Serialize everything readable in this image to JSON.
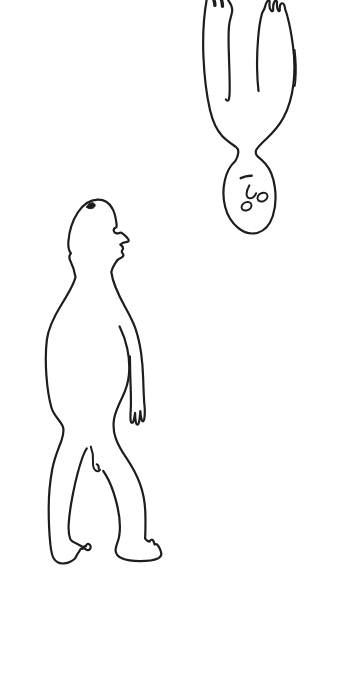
{
  "canvas": {
    "width": 354,
    "height": 679,
    "background": "#ffffff",
    "ink": "#1d1d1d",
    "stroke_width": 2.2
  },
  "drawing": {
    "figures": [
      {
        "name": "standing-figure",
        "paths": [
          {
            "name": "head-back-body-back-leg-outline",
            "d": "M 112,208 C 109,202.5 103.5,199.4 97.5,199.6 C 90.5,199.8 83,204.5 77.8,212.5 C 72.4,220.8 69.2,230.5 68.4,241.5 C 68,247 69,251 70.9,253.2 C 69.3,255.2 68.8,257.8 70.3,260.8 C 72.2,264.6 74.3,269.8 75.5,277 C 74,284 69.8,291.2 61.5,304.5 C 53.5,317.5 48.4,327.5 46.9,339.5 C 45.4,351.5 45.6,364 46.4,375.5 C 47.2,386.5 48.6,397.5 51.4,407.5 C 53.6,415.5 59.4,419.5 62.4,425.5 C 64.2,429.1 64,432.9 61.6,440.1 C 59.2,447.3 54.6,456.5 52.2,469.5 C 49.8,482.5 48.7,495.5 48.7,508.5 C 48.7,521.5 49.3,534 50.3,544 C 51,550.5 52,555.4 53.6,558.3 C 55.9,562.2 59.9,563.9 64.4,563.4 C 68.2,563 72.2,561.2 75.2,558.2 C 76.6,555.4 78.2,552.8 79.4,551.2 C 80.1,549.1 81.5,548 82.7,548.9 C 83.1,546.7 84.5,545.5 85.9,546.3 C 86.3,544.3 87.7,543.4 89.1,544.2 C 90.7,545.1 91.1,547.2 90.1,548.8 C 89.1,550.4 87.3,550.6 85.9,549.4 C 83.9,547.8 80.9,545.3 77.4,543.9 C 73.9,542.5 71.2,541.2 70.2,538.8 C 69,535.5 68.4,531 68.6,525.5 C 69,516.5 70.6,505.5 73.2,492.5 C 75.8,479.5 79.2,466.5 82.8,456.5 C 84.2,452.7 85.6,449.9 86.8,448.3"
          },
          {
            "name": "face-profile-neck-arm-hand",
            "d": "M 112,208 C 114.2,211.2 115.6,216.5 116.5,223.5 C 116.7,225.3 116.6,226.5 116.3,227.3 C 114.6,227.9 113.4,229.5 113.9,231.2 C 114.5,233.2 117.1,233.9 119.3,232.9 C 120.5,232.4 121.5,232.7 122.7,233.7 C 124.7,235.2 126.9,236.9 128.3,239.3 C 129,240.5 128.6,241.7 127.1,241.9 C 124.9,242.2 121.9,243.1 120.3,244.5 C 122.5,246.1 123.7,248.1 122.5,249.9 C 121.5,251.3 121.3,252.2 122.7,253.5 C 123.9,254.7 123.5,256.6 121.5,257.5 C 119.1,258.5 117.1,260.1 115.9,262.1 C 113.7,265.4 112.1,268.4 111.3,272 C 111.9,276.5 113.3,281.5 115.5,287 C 117.9,293 121.1,299.8 124.7,306.3 C 128.5,313.2 132.3,319.9 135.3,328.2 C 138.1,336.2 139.9,344.7 141.2,353.7 C 142.3,361.7 142.9,370.2 143.2,378.7 C 143.4,386.7 143.8,395.2 144.2,402.7 L 144.5,405.5 C 144.9,409.3 144.9,414.8 144.3,418.8 C 143.8,421.9 142.4,422.3 141.6,419.4 C 140.9,416.9 140.5,413.8 140.3,411 C 140,414.4 139.8,418.9 139,422.3 C 138.3,425.5 136.6,425.6 135.9,422.5 C 135.3,419.7 135.1,416 135.1,412.8 C 134.7,415.6 134.3,419 133.4,421.3 C 132.5,423.7 130.9,423.2 130.6,420.4 C 130.3,417.2 130.5,412.8 130.8,408.8 C 131.1,402.3 130.9,393.8 130.6,385.3 C 130.3,377.3 130.1,368.3 130,361.3 L 129.9,356.3"
          },
          {
            "name": "chest-hip-front-leg-foot",
            "d": "M 119.6,326.5 C 122.6,332.5 125.5,340.3 127.3,348.8 C 129.1,357.3 129.7,366.3 128.9,374.8 C 128.1,382.8 125.7,390.3 122.3,397.3 C 118.9,404.3 115.5,411.3 114.2,418.3 C 113,424.8 113.4,431.3 115.6,437.8 C 117.9,444.6 121.7,451.1 126.5,458.1 C 131.9,466.1 136.7,474.6 140.1,484.1 C 143.4,493.4 145,503.1 145.3,512.1 C 145.6,521.1 145.5,530.1 145.1,538.6 C 146.4,540.4 148,541.4 149.6,541.6 C 150.4,539.4 152.4,539 153.4,541 C 153.8,541.9 154.4,543.3 154.6,544.5 C 155.8,543.9 157.4,544.5 158.4,546.1 C 159.8,548.3 161,550.9 161.3,553.1 C 161.6,555.3 160.3,557.3 157.8,558.5 C 153.8,560.3 147.3,561.1 140.3,561.1 C 133.3,561.1 126.3,560.3 121.8,558.3 C 118.3,556.7 115.9,554.1 115.6,550.6 C 115.4,547.8 116.6,544.9 118,540.9 C 119.3,537.1 119.9,532.1 119.9,526.6 C 119.9,518.6 118.3,509.1 115.7,499.6 C 113.1,490.1 109.5,481.1 105.9,475.1 L 103.2,470.9"
          },
          {
            "name": "crotch-squiggle",
            "d": "M 90.8,446.6 C 92.6,451.2 93.4,456.4 93,461.4 C 92.7,465.4 93.4,468.6 95.3,470.3 C 97.1,471.9 99.3,471.5 100.1,469.6",
            "w": 2
          },
          {
            "name": "crotch-mark",
            "d": "M 96.6,464.2 C 98.3,465 99.1,466.9 98.6,468.9",
            "w": 2
          },
          {
            "name": "head-ink-blob",
            "d": "M 86.6,207.2 C 87.4,204 90.6,202 93.4,203 C 95.8,203.9 95.8,206.6 93.4,207.9 C 91,209.2 88,208.9 86.6,207.2 Z",
            "fill": "#1d1d1d",
            "w": 1
          }
        ]
      },
      {
        "name": "inverted-figure",
        "paths": [
          {
            "name": "torso-arms-head-outline",
            "d": "M 206.6,0 C 203.8,16 202.6,36 203.4,56 C 204.2,75.5 206.4,94.5 210,110 C 212.6,121 216.6,130 222.2,136 C 226.6,140.7 231.6,143.9 235.9,146.9 C 237.7,148.2 238.5,150 238.3,152.6 C 238.1,155.6 237.1,158.3 235.1,161.3 C 230.5,165.4 226.7,172 224.8,180.5 C 222.9,189 223,198.5 225.2,207 C 227.4,215.5 231.8,222.6 237.8,227.6 C 243.8,232.6 251,234.7 257.8,232.7 C 264.6,230.7 270,224.5 272.8,216 C 275.6,207.5 276.2,197 274.8,187 C 273.4,177 270,169 265.4,163.8 C 262.8,160.8 260,158.4 257.6,156.4 C 256,155 255.4,152.8 256,150.2 C 258,146.8 262,142.8 267,138.2 C 273,132.6 279,125.8 283.4,117.8 C 288.4,108.3 291.9,96.8 293.4,84.3 C 294.9,71.8 294.7,58.3 292.9,45.3 C 291.7,36.3 289.8,25.3 287.4,16.3 C 286.8,13.8 286,11.3 285.2,9.3 C 284.8,5.3 283.6,2.9 282,3.3 C 280.4,3.7 279.6,6.4 279.8,9.4 C 279.9,11.1 279.4,11.7 278.4,10.7 C 277.2,9.4 276.8,5.9 277,2.9 C 277.1,0.7 275.8,-0.1 274.6,1.5 C 273.4,3.1 273,6.4 273.2,9.4 C 273.3,11.3 272.4,11.8 271.2,10.6 C 269.8,9.1 269.2,5.4 269.6,2.3 C 269.8,0.5 268.6,-0.3 267.4,1.1 C 266.2,2.5 265.4,4.9 264.8,7.5 C 264.2,9.9 262.6,11.5 261.9,13.7 C 260.3,19.7 258.9,28.3 258.1,38.3 C 257.3,48.3 256.9,58.3 257.1,68.3 C 257.2,76.3 257.7,84.3 258.5,90.9"
          },
          {
            "name": "left-inner-arm",
            "d": "M 228.2,0.3 C 230.8,3.7 232.7,7.5 232.1,11.7 C 231.5,15.9 229.7,19.5 229.1,25.3 C 228.3,32.9 228.5,43.9 228.9,54.9 C 229.3,65.9 229.7,77.9 229.7,87.9 C 229.7,92.4 229.5,96.4 228.9,99.3 C 228.3,101.1 226.7,100.9 225.9,99.5"
          },
          {
            "name": "left-hand-finger-mark-1",
            "d": "M 213.9,0 C 214.5,1.8 214.9,3.8 214.9,5.4",
            "w": 3.4
          },
          {
            "name": "left-hand-finger-mark-2",
            "d": "M 221.5,0 C 222.1,2.2 222.5,4.4 222.5,6.2",
            "w": 3.4
          },
          {
            "name": "right-arm-restroke",
            "d": "M 294.7,50 C 295.9,60 296.3,70 295.5,80 C 295.3,82.5 295,84.5 294.7,86",
            "w": 1.8
          },
          {
            "name": "mouth-line",
            "d": "M 240.7,178.2 C 244.1,176.6 248.3,175.6 251.7,175.8",
            "w": 2.4
          },
          {
            "name": "nose-line",
            "d": "M 249.3,185.4 C 247.5,188.6 246.1,192.4 246.7,195.4 C 247.3,198.2 250.1,199 252.7,197.6 C 254.3,196.7 255.5,195.1 256.1,193.3",
            "w": 2
          },
          {
            "name": "eye-right",
            "d": "M 257.9,199.7 C 256.7,197.5 258.1,194.5 260.9,193.3 C 263.7,192.1 266.5,192.9 267.3,195.1 C 268.1,197.3 266.5,200.1 263.7,201.1 C 261.3,201.9 258.9,201.5 257.9,199.7 Z",
            "w": 1.9
          },
          {
            "name": "eye-left",
            "d": "M 241.9,208.7 C 240.9,206.5 242.3,203.7 245.1,202.5 C 247.9,201.3 250.5,202.1 251.3,204.3 C 252.1,206.5 250.5,209.1 247.7,210.1 C 245.3,210.9 242.9,210.5 241.9,208.7 Z",
            "w": 1.9
          }
        ]
      }
    ]
  }
}
